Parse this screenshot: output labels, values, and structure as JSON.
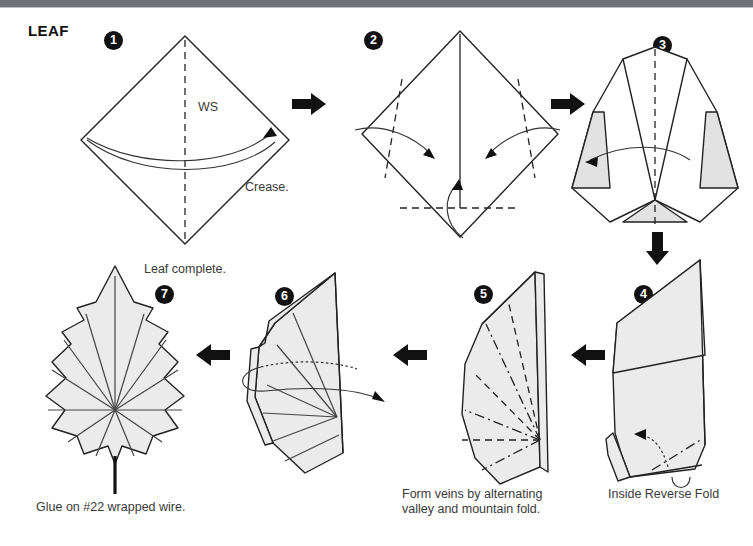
{
  "page": {
    "title": "LEAF",
    "background_color": "#ffffff",
    "topbar_color": "#6e7176",
    "paper_fill": "#ebebeb",
    "paper_shade_fill": "#e2e2e2",
    "line_color": "#222222"
  },
  "labels": {
    "ws": "WS",
    "crease": "Crease.",
    "leaf_complete": "Leaf complete.",
    "glue_wire": "Glue on #22 wrapped wire.",
    "form_veins": "Form veins by alternating\nvalley and mountain fold.",
    "inside_reverse_fold": "Inside Reverse Fold"
  },
  "steps": [
    {
      "number": "1",
      "badge": "❶"
    },
    {
      "number": "2",
      "badge": "❷"
    },
    {
      "number": "3",
      "badge": "❸"
    },
    {
      "number": "4",
      "badge": "❹"
    },
    {
      "number": "5",
      "badge": "❺"
    },
    {
      "number": "6",
      "badge": "❻"
    },
    {
      "number": "7",
      "badge": "❼"
    }
  ],
  "flow_arrows": [
    {
      "name": "arrow-step1-to-step2",
      "direction": "right"
    },
    {
      "name": "arrow-step2-to-step3",
      "direction": "right"
    },
    {
      "name": "arrow-step3-to-step4",
      "direction": "down"
    },
    {
      "name": "arrow-step4-to-step5",
      "direction": "left"
    },
    {
      "name": "arrow-step5-to-step6",
      "direction": "left"
    },
    {
      "name": "arrow-step6-to-step7",
      "direction": "left"
    }
  ]
}
